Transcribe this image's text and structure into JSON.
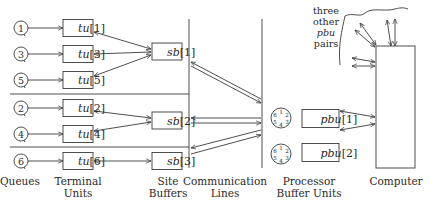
{
  "colors": {
    "ink": "#3a3a3a",
    "background": "#ffffff"
  },
  "queues": [
    {
      "id": "q1",
      "label": "1",
      "row": 0
    },
    {
      "id": "q3",
      "label": "3",
      "row": 1
    },
    {
      "id": "q5",
      "label": "5",
      "row": 2
    },
    {
      "id": "q2",
      "label": "2",
      "row": 3
    },
    {
      "id": "q4",
      "label": "4",
      "row": 4
    },
    {
      "id": "q6",
      "label": "6",
      "row": 5
    }
  ],
  "terminal_units": [
    {
      "name": "tu",
      "index": "[1]",
      "site": "sb[1]"
    },
    {
      "name": "tu",
      "index": "[3]",
      "site": "sb[1]"
    },
    {
      "name": "tu",
      "index": "[5]",
      "site": "sb[1]"
    },
    {
      "name": "tu",
      "index": "[2]",
      "site": "sb[2]"
    },
    {
      "name": "tu",
      "index": "[4]",
      "site": "sb[2]"
    },
    {
      "name": "tu",
      "index": "[6]",
      "site": "sb[3]"
    }
  ],
  "site_buffers": [
    {
      "name": "sb",
      "index": "[1]"
    },
    {
      "name": "sb",
      "index": "[2]"
    },
    {
      "name": "sb",
      "index": "[3]"
    }
  ],
  "processor_buffer_units": [
    {
      "name": "pbu",
      "index": "[1]"
    },
    {
      "name": "pbu",
      "index": "[2]"
    }
  ],
  "clock_dials": [
    {
      "numbers": [
        "1",
        "2",
        "3",
        "4",
        "5",
        "6"
      ]
    },
    {
      "numbers": [
        "1",
        "2",
        "3",
        "4",
        "5",
        "6"
      ]
    }
  ],
  "annotation": {
    "line1": "three",
    "line2": "other",
    "line3": "pbu",
    "line4": "pairs"
  },
  "column_labels": {
    "queues": "Queues",
    "terminal_units_1": "Terminal",
    "terminal_units_2": "Units",
    "site_buffers_1": "Site",
    "site_buffers_2": "Buffers",
    "communication_lines_1": "Communication",
    "communication_lines_2": "Lines",
    "processor_buffer_units_1": "Processor",
    "processor_buffer_units_2": "Buffer Units",
    "computer": "Computer"
  }
}
